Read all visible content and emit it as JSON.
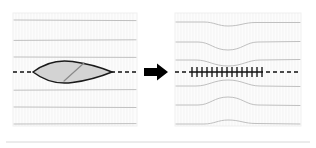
{
  "figure": {
    "title": "Wound closure with interrupted sutures",
    "background_color": "#ffffff",
    "width": 316,
    "height": 148
  },
  "colors": {
    "panel_fill": "#fcfcfc",
    "panel_border": "#f0f0f0",
    "skin_hatch": "#ededed",
    "skin_line": "#b9b9b9",
    "incision_dash": "#111111",
    "wound_fill": "#d3d3d3",
    "wound_outline": "#1a1a1a",
    "wound_inner_line": "#8a8a8a",
    "suture": "#111111",
    "arrow": "#000000",
    "footer_rule": "#d8d8d8"
  },
  "panels": [
    {
      "id": "before",
      "label": "Open elliptical wound on incision line",
      "x": 13,
      "y": 13,
      "width": 124,
      "height": 113,
      "incision": {
        "label": "dashed incision line",
        "y": 72,
        "dash_pattern": "4 3",
        "left_segment": [
          13,
          33
        ],
        "right_segment": [
          112,
          137
        ]
      },
      "wound": {
        "label": "lens-shaped open wound",
        "left_tip_x": 33,
        "right_tip_x": 112,
        "center_y": 72,
        "half_height": 10,
        "inner_line_label": "wound depth marker",
        "inner_line": [
          64,
          81,
          84,
          63
        ]
      },
      "skin_lines": [
        {
          "y": 20,
          "label": "skin-crease-1"
        },
        {
          "y": 40,
          "label": "skin-crease-2"
        },
        {
          "y": 57,
          "label": "skin-crease-3"
        },
        {
          "y": 90,
          "label": "skin-crease-4"
        },
        {
          "y": 107,
          "label": "skin-crease-5"
        },
        {
          "y": 124,
          "label": "skin-crease-6"
        }
      ]
    },
    {
      "id": "after",
      "label": "Closed wound with interrupted sutures",
      "x": 175,
      "y": 13,
      "width": 126,
      "height": 113,
      "incision": {
        "label": "closed suture line",
        "y": 72,
        "dash_pattern": "4 3",
        "left_segment": [
          175,
          190
        ],
        "closed_segment": [
          190,
          262
        ],
        "right_segment": [
          266,
          301
        ]
      },
      "sutures": {
        "label": "interrupted suture ticks",
        "count": 15,
        "first_x": 192,
        "last_x": 262,
        "tick_half_height": 5
      },
      "skin_lines": [
        {
          "y": 22,
          "label": "puckered-crease-1",
          "deflection": -4,
          "direction": "down"
        },
        {
          "y": 42,
          "label": "puckered-crease-2",
          "deflection": -8,
          "direction": "down"
        },
        {
          "y": 60,
          "label": "puckered-crease-3",
          "deflection": -6,
          "direction": "down"
        },
        {
          "y": 86,
          "label": "puckered-crease-4",
          "deflection": 6,
          "direction": "up"
        },
        {
          "y": 105,
          "label": "puckered-crease-5",
          "deflection": 8,
          "direction": "up"
        },
        {
          "y": 124,
          "label": "puckered-crease-6",
          "deflection": 4,
          "direction": "up"
        }
      ]
    }
  ],
  "arrow": {
    "label": "transition arrow pointing right",
    "direction": "right",
    "x": 144,
    "y": 72,
    "length": 24,
    "shaft_thickness": 8,
    "head_width": 11,
    "head_length": 11
  },
  "footer_rule": {
    "label": "bottom divider rule",
    "y": 142,
    "x_start": 6,
    "x_end": 310
  }
}
